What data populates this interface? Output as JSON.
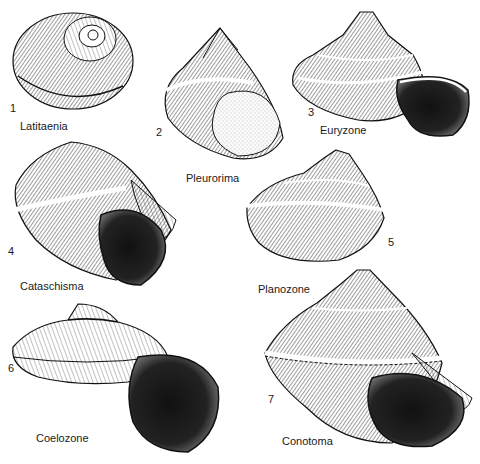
{
  "plate": {
    "background": "#ffffff",
    "ink": "#1a1a1a",
    "figures": [
      {
        "number": "1",
        "name": "Latitaenia"
      },
      {
        "number": "2",
        "name": "Pleurorima"
      },
      {
        "number": "3",
        "name": "Euryzone"
      },
      {
        "number": "4",
        "name": "Cataschisma"
      },
      {
        "number": "5",
        "name": "Planozone"
      },
      {
        "number": "6",
        "name": "Coelozone"
      },
      {
        "number": "7",
        "name": "Conotoma"
      }
    ]
  }
}
